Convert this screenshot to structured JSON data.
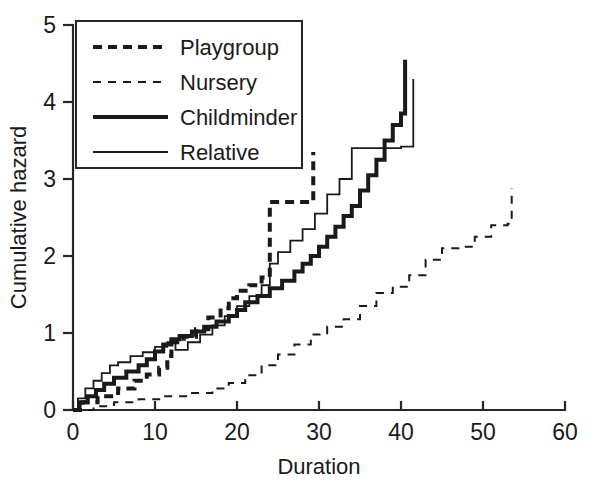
{
  "chart_data": {
    "type": "line",
    "title": "",
    "xlabel": "Duration",
    "ylabel": "Cumulative hazard",
    "xlim": [
      0,
      60
    ],
    "ylim": [
      0,
      5
    ],
    "xticks": [
      0,
      10,
      20,
      30,
      40,
      50,
      60
    ],
    "yticks": [
      0,
      1,
      2,
      3,
      4,
      5
    ],
    "xtick_labels": [
      "0",
      "10",
      "20",
      "30",
      "40",
      "50",
      "60"
    ],
    "ytick_labels": [
      "0",
      "1",
      "2",
      "3",
      "4",
      "5"
    ],
    "grid": false,
    "step_type": "post",
    "legend_position": "upper-left-inset",
    "series": [
      {
        "name": "Playgroup",
        "style": "thick-dashed",
        "color": "#1a1a1a",
        "x": [
          0,
          1.2,
          3.0,
          5.5,
          7.5,
          9.0,
          10.5,
          11.5,
          12.0,
          13.5,
          15.0,
          16.5,
          18.0,
          19.0,
          20.0,
          21.5,
          23.0,
          24.0,
          29.0,
          29.3
        ],
        "y": [
          0,
          0.1,
          0.18,
          0.28,
          0.38,
          0.46,
          0.55,
          0.7,
          0.88,
          0.95,
          1.05,
          1.2,
          1.32,
          1.45,
          1.55,
          1.62,
          1.72,
          2.7,
          2.7,
          3.35
        ]
      },
      {
        "name": "Nursery",
        "style": "thin-dashed",
        "color": "#1a1a1a",
        "x": [
          0,
          2.5,
          5.0,
          8.0,
          11.0,
          14.0,
          17.0,
          19.0,
          21.0,
          23.0,
          25.0,
          27.0,
          29.0,
          31.0,
          33.0,
          35.0,
          37.0,
          39.0,
          41.0,
          43.0,
          45.0,
          47.0,
          49.0,
          51.0,
          53.0,
          53.5
        ],
        "y": [
          0,
          0.05,
          0.1,
          0.14,
          0.18,
          0.22,
          0.28,
          0.35,
          0.45,
          0.58,
          0.72,
          0.85,
          0.98,
          1.08,
          1.18,
          1.35,
          1.52,
          1.6,
          1.75,
          1.95,
          2.1,
          2.12,
          2.25,
          2.4,
          2.42,
          2.88
        ]
      },
      {
        "name": "Childminder",
        "style": "thick-solid",
        "color": "#1a1a1a",
        "x": [
          0,
          0.8,
          1.8,
          2.8,
          3.8,
          5.0,
          6.5,
          8.0,
          9.0,
          10.0,
          11.0,
          12.0,
          13.0,
          14.5,
          16.0,
          17.5,
          19.0,
          20.0,
          21.0,
          22.5,
          24.0,
          25.5,
          27.0,
          28.0,
          29.0,
          30.0,
          31.0,
          32.0,
          33.0,
          34.0,
          35.0,
          36.0,
          37.0,
          38.0,
          39.0,
          40.0,
          40.5
        ],
        "y": [
          0,
          0.1,
          0.18,
          0.26,
          0.34,
          0.42,
          0.5,
          0.58,
          0.66,
          0.76,
          0.85,
          0.92,
          0.96,
          1.02,
          1.08,
          1.15,
          1.22,
          1.3,
          1.4,
          1.48,
          1.58,
          1.68,
          1.8,
          1.9,
          2.0,
          2.12,
          2.25,
          2.38,
          2.52,
          2.65,
          2.85,
          3.05,
          3.25,
          3.5,
          3.7,
          3.85,
          4.55
        ]
      },
      {
        "name": "Relative",
        "style": "thin-solid",
        "color": "#1a1a1a",
        "x": [
          0,
          0.6,
          1.5,
          2.5,
          3.5,
          4.5,
          5.5,
          7.0,
          8.5,
          10.0,
          11.5,
          12.5,
          14.0,
          15.5,
          17.0,
          18.5,
          20.0,
          21.5,
          23.0,
          24.0,
          25.0,
          26.5,
          28.0,
          29.5,
          31.0,
          32.5,
          34.0,
          35.0,
          38.5,
          40.0,
          41.0,
          41.5
        ],
        "y": [
          0,
          0.15,
          0.28,
          0.38,
          0.48,
          0.58,
          0.62,
          0.7,
          0.75,
          0.82,
          0.88,
          0.78,
          0.88,
          0.98,
          1.1,
          1.22,
          1.35,
          1.48,
          1.62,
          1.9,
          2.05,
          2.2,
          2.35,
          2.55,
          2.8,
          3.0,
          3.4,
          3.4,
          3.4,
          3.42,
          3.42,
          4.3
        ]
      }
    ]
  },
  "legend": {
    "entries": [
      {
        "label": "Playgroup",
        "style": "thick-dashed"
      },
      {
        "label": "Nursery",
        "style": "thin-dashed"
      },
      {
        "label": "Childminder",
        "style": "thick-solid"
      },
      {
        "label": "Relative",
        "style": "thin-solid"
      }
    ]
  },
  "axes": {
    "x_title": "Duration",
    "y_title": "Cumulative hazard"
  },
  "colors": {
    "ink": "#1a1a1a",
    "axis": "#262626",
    "background": "#ffffff"
  }
}
